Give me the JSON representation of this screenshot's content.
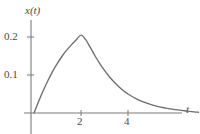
{
  "chart_data": {
    "type": "line",
    "title": "",
    "subtitle": "",
    "xlabel": "t",
    "ylabel": "x(t)",
    "xlim": [
      -0.3,
      7.1
    ],
    "ylim": [
      -0.012,
      0.25
    ],
    "grid": false,
    "legend": null,
    "xticks": [
      2,
      4
    ],
    "xtick_labels": [
      "2",
      "4"
    ],
    "yticks": [
      0.1,
      0.2
    ],
    "ytick_labels": [
      "0.1",
      "0.2"
    ],
    "series": [
      {
        "name": "x(t)",
        "color": "#6e6e6e",
        "x": [
          0.0,
          0.2,
          0.4,
          0.6,
          0.8,
          1.0,
          1.2,
          1.4,
          1.6,
          1.8,
          2.0,
          2.2,
          2.4,
          2.6,
          2.8,
          3.0,
          3.2,
          3.4,
          3.6,
          3.8,
          4.0,
          4.4,
          4.8,
          5.2,
          5.6,
          6.0,
          6.4,
          6.8,
          7.0
        ],
        "y": [
          0.0,
          0.031,
          0.06,
          0.086,
          0.11,
          0.131,
          0.15,
          0.166,
          0.18,
          0.193,
          0.205,
          0.193,
          0.172,
          0.15,
          0.13,
          0.112,
          0.096,
          0.082,
          0.07,
          0.059,
          0.05,
          0.036,
          0.026,
          0.018,
          0.013,
          0.009,
          0.006,
          0.003,
          0.002
        ]
      }
    ],
    "peak": {
      "x": 2.0,
      "y": 0.205
    },
    "axis_color": "#7a7a7a",
    "text_color": "#4a4a4a"
  },
  "axes": {
    "y_axis_title": "x(t)",
    "x_axis_title": "t",
    "y_tick_upper": "0.2",
    "y_tick_lower": "0.1",
    "x_tick_left": "2",
    "x_tick_right": "4"
  }
}
